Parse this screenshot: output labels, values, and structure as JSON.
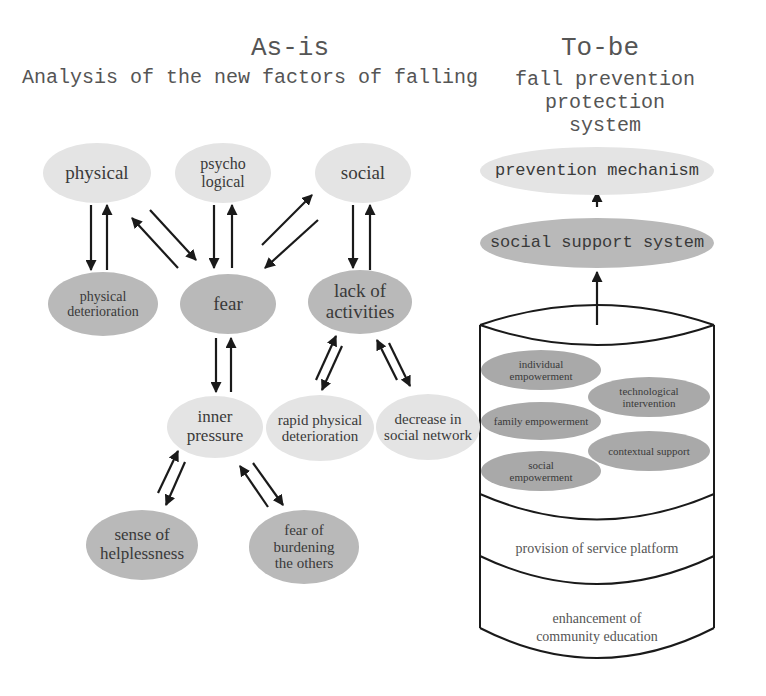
{
  "as_is": {
    "title": "As-is",
    "subtitle": "Analysis of the new factors of falling",
    "nodes": {
      "physical": "physical",
      "psychological": "psycho\nlogical",
      "social": "social",
      "physical_deterioration": "physical\ndeterioration",
      "fear": "fear",
      "lack_of_activities": "lack of\nactivities",
      "inner_pressure": "inner\npressure",
      "rapid_physical_deterioration": "rapid physical\ndeterioration",
      "decrease_in_social_network": "decrease in\nsocial network",
      "sense_of_helplessness": "sense of\nhelplessness",
      "fear_of_burdening": "fear of\nburdening\nthe others"
    },
    "relations": [
      [
        "physical",
        "physical_deterioration",
        "bidirectional"
      ],
      [
        "physical",
        "fear",
        "bidirectional"
      ],
      [
        "psychological",
        "fear",
        "bidirectional"
      ],
      [
        "social",
        "fear",
        "bidirectional"
      ],
      [
        "social",
        "lack_of_activities",
        "bidirectional"
      ],
      [
        "fear",
        "inner_pressure",
        "bidirectional"
      ],
      [
        "lack_of_activities",
        "rapid_physical_deterioration",
        "bidirectional"
      ],
      [
        "lack_of_activities",
        "decrease_in_social_network",
        "bidirectional"
      ],
      [
        "inner_pressure",
        "sense_of_helplessness",
        "bidirectional"
      ],
      [
        "inner_pressure",
        "fear_of_burdening",
        "bidirectional"
      ]
    ]
  },
  "to_be": {
    "title": "To-be",
    "subtitle": "fall prevention protection\nsystem",
    "prevention_mechanism": "prevention mechanism",
    "social_support_system": "social support system",
    "cylinder": {
      "top_layer_items": {
        "individual_empowerment": "individual\nempowerment",
        "technological_intervention": "technological\nintervention",
        "family_empowerment": "family empowerment",
        "contextual_support": "contextual support",
        "social_empowerment": "social\nempowerment"
      },
      "middle_layer": "provision of service platform",
      "bottom_layer": "enhancement of\ncommunity education"
    }
  },
  "colors": {
    "light_node": "#e4e4e4",
    "dark_node": "#b9b9b9",
    "inner_node": "#a9a9a9",
    "line": "#1a1a1a"
  }
}
